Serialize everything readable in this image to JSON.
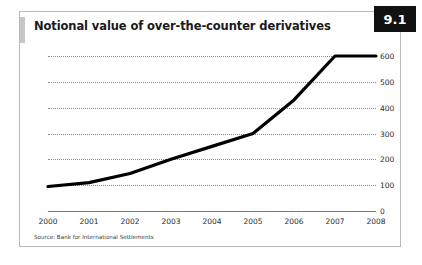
{
  "figure": {
    "badge": "9.1",
    "title": "Notional value of over-the-counter derivatives",
    "source": "Source: Bank for International Settlements"
  },
  "chart_data": {
    "type": "line",
    "title": "Notional value of over-the-counter derivatives",
    "xlabel": "",
    "ylabel": "",
    "categories": [
      "2000",
      "2001",
      "2002",
      "2003",
      "2004",
      "2005",
      "2006",
      "2007",
      "2008"
    ],
    "x": [
      2000,
      2001,
      2002,
      2003,
      2004,
      2005,
      2006,
      2007,
      2008
    ],
    "values": [
      95,
      110,
      145,
      200,
      250,
      300,
      430,
      600,
      600
    ],
    "series": [
      {
        "name": "Notional value of over-the-counter derivatives",
        "values": [
          95,
          110,
          145,
          200,
          250,
          300,
          430,
          600,
          600
        ],
        "color": "#000000"
      }
    ],
    "yticks": [
      0,
      100,
      200,
      300,
      400,
      500,
      600
    ],
    "ytick_labels": [
      "0",
      "100",
      "200",
      "300",
      "400",
      "500",
      "600"
    ],
    "xtick_labels": [
      "2000",
      "2001",
      "2002",
      "2003",
      "2004",
      "2005",
      "2006",
      "2007",
      "2008"
    ],
    "ylim": [
      0,
      620
    ],
    "xlim": [
      2000,
      2008
    ],
    "grid": true,
    "grid_style": "dotted",
    "grid_color": "#8c8c8c",
    "legend": false,
    "legend_position": "none",
    "line_color": "#000000",
    "line_width": 3,
    "annotations": [
      "Source: Bank for International Settlements"
    ]
  }
}
